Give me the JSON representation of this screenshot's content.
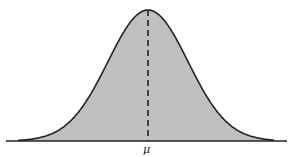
{
  "chart_data": {
    "type": "area",
    "title": "",
    "xlabel": "",
    "ylabel": "",
    "x_tick_labels": [
      "μ"
    ],
    "mean_label": "μ",
    "distribution": "normal",
    "mean": 0,
    "std": 1,
    "xlim": [
      -3.5,
      3.5
    ],
    "grid": false,
    "legend": null,
    "fill_color": "#c0c0c0",
    "line_color": "#222222",
    "mean_line_style": "dashed"
  }
}
